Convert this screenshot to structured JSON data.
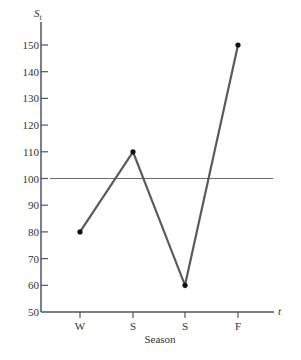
{
  "chart_data": {
    "type": "line",
    "title": "",
    "xlabel": "Season",
    "ylabel": "S_t",
    "ylabel_main": "S",
    "ylabel_sub": "t",
    "x_axis_var": "t",
    "categories": [
      "W",
      "S",
      "S",
      "F"
    ],
    "values": [
      80,
      110,
      60,
      150
    ],
    "ylim": [
      50,
      150
    ],
    "yticks": [
      50,
      60,
      70,
      80,
      90,
      100,
      110,
      120,
      130,
      140,
      150
    ],
    "reference_line": {
      "y": 100
    },
    "grid": false,
    "legend": null
  },
  "colors": {
    "series": "#5a5a5a",
    "axis": "#555555",
    "reference": "#6a6a6a",
    "marker": "#111111"
  }
}
